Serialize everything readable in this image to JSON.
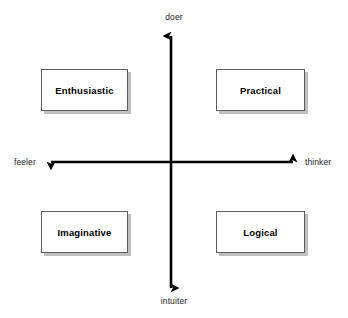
{
  "diagram": {
    "background_color": "#ffffff",
    "axis_color": "#000000",
    "box_border_color": "#5d5d5d",
    "box_shadow_color": "#bfbfbf",
    "box_fill_color": "#ffffff",
    "text_color": "#000000"
  },
  "axes": {
    "vertical": {
      "top_label": "doer",
      "bottom_label": "intuiter",
      "arrow_style": "double-headed",
      "center_x": 171,
      "top_y": 33,
      "bottom_y": 291
    },
    "horizontal": {
      "left_label": "feeler",
      "right_label": "thinker",
      "arrow_style": "double-headed",
      "center_y": 162,
      "left_x": 48,
      "right_x": 296
    }
  },
  "quadrants": [
    {
      "id": "top-left",
      "label": "Enthusiastic",
      "vertical_pole": "doer",
      "horizontal_pole": "feeler"
    },
    {
      "id": "top-right",
      "label": "Practical",
      "vertical_pole": "doer",
      "horizontal_pole": "thinker"
    },
    {
      "id": "bottom-left",
      "label": "Imaginative",
      "vertical_pole": "intuiter",
      "horizontal_pole": "feeler"
    },
    {
      "id": "bottom-right",
      "label": "Logical",
      "vertical_pole": "intuiter",
      "horizontal_pole": "thinker"
    }
  ]
}
